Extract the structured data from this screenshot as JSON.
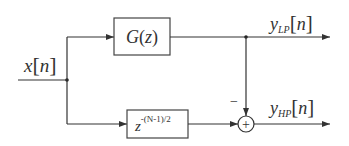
{
  "diagram": {
    "type": "block-diagram",
    "input": {
      "label": "x",
      "index": "n"
    },
    "blocks": [
      {
        "id": "lowpass",
        "label": "G(z)",
        "fn": "G",
        "arg": "z"
      },
      {
        "id": "delay",
        "base": "z",
        "exponent": "-(N-1)/2"
      }
    ],
    "summer": {
      "symbol": "+",
      "minus_sign": "−"
    },
    "outputs": [
      {
        "id": "lp",
        "label": "y",
        "subscript": "LP",
        "index": "n"
      },
      {
        "id": "hp",
        "label": "y",
        "subscript": "HP",
        "index": "n"
      }
    ],
    "colors": {
      "line": "#333333",
      "text": "#333333",
      "background": "#ffffff"
    }
  }
}
